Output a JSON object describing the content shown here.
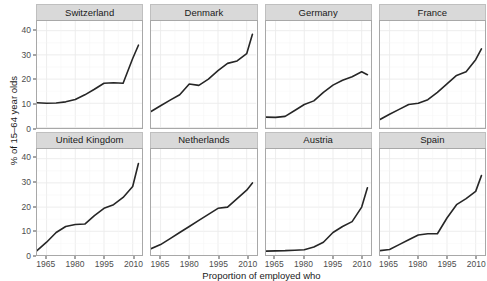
{
  "chart_data": {
    "type": "line",
    "title": "",
    "xlabel": "Proportion of employed who",
    "ylabel": "% of 15–64 year olds",
    "xlim": [
      1960,
      2015
    ],
    "ylim": [
      0,
      44
    ],
    "xticks": [
      1965,
      1980,
      1995,
      2010
    ],
    "yticks": [
      0,
      10,
      20,
      30,
      40
    ],
    "grid": true,
    "legend": "none",
    "facet_layout": "2 rows x 4 columns",
    "line_color": "#262626",
    "panel_background": "#ffffff",
    "strip_background": "#d9d9d9",
    "grid_color": "#ebebeb",
    "series": [
      {
        "name": "Switzerland",
        "x": [
          1960,
          1965,
          1970,
          1975,
          1980,
          1985,
          1990,
          1995,
          2000,
          2005,
          2010,
          2013
        ],
        "values": [
          10.2,
          10.0,
          10.1,
          10.6,
          11.6,
          13.5,
          15.8,
          18.3,
          18.5,
          18.3,
          28.5,
          34.0
        ]
      },
      {
        "name": "Denmark",
        "x": [
          1960,
          1965,
          1970,
          1975,
          1980,
          1985,
          1990,
          1995,
          2000,
          2005,
          2010,
          2013
        ],
        "values": [
          6.6,
          9.0,
          11.3,
          13.5,
          18.0,
          17.4,
          20.0,
          23.5,
          26.5,
          27.5,
          30.5,
          38.5
        ]
      },
      {
        "name": "Germany",
        "x": [
          1960,
          1965,
          1970,
          1975,
          1980,
          1985,
          1990,
          1995,
          2000,
          2005,
          2010,
          2013
        ],
        "values": [
          4.3,
          4.2,
          4.6,
          7.0,
          9.5,
          11.0,
          14.5,
          17.5,
          19.5,
          21.0,
          23.0,
          21.8
        ]
      },
      {
        "name": "France",
        "x": [
          1960,
          1965,
          1970,
          1975,
          1980,
          1985,
          1990,
          1995,
          2000,
          2005,
          2010,
          2013
        ],
        "values": [
          3.3,
          5.5,
          7.5,
          9.5,
          10.0,
          11.5,
          14.5,
          18.0,
          21.5,
          23.0,
          28.0,
          32.5
        ]
      },
      {
        "name": "United Kingdom",
        "x": [
          1960,
          1965,
          1970,
          1975,
          1980,
          1985,
          1990,
          1995,
          2000,
          2005,
          2010,
          2013
        ],
        "values": [
          2.0,
          5.5,
          9.5,
          12.0,
          12.8,
          13.0,
          16.5,
          19.5,
          21.0,
          24.0,
          28.5,
          38.0
        ]
      },
      {
        "name": "Netherlands",
        "x": [
          1960,
          1965,
          1970,
          1975,
          1980,
          1985,
          1990,
          1995,
          2000,
          2005,
          2010,
          2013
        ],
        "values": [
          2.8,
          4.5,
          7.0,
          9.5,
          12.0,
          14.5,
          17.0,
          19.5,
          20.0,
          23.5,
          27.0,
          30.0
        ]
      },
      {
        "name": "Austria",
        "x": [
          1960,
          1965,
          1970,
          1975,
          1980,
          1985,
          1990,
          1995,
          2000,
          2005,
          2010,
          2013
        ],
        "values": [
          1.8,
          1.9,
          2.0,
          2.2,
          2.4,
          3.5,
          5.5,
          9.5,
          12.0,
          14.0,
          20.0,
          28.0
        ]
      },
      {
        "name": "Spain",
        "x": [
          1960,
          1965,
          1970,
          1975,
          1980,
          1985,
          1990,
          1995,
          2000,
          2005,
          2010,
          2013
        ],
        "values": [
          2.0,
          2.5,
          4.5,
          6.5,
          8.5,
          9.0,
          9.0,
          15.5,
          21.0,
          23.5,
          26.5,
          33.0
        ]
      }
    ]
  },
  "axis": {
    "y_title": "% of 15–64 year olds",
    "x_title": "Proportion of employed who",
    "y_ticks": [
      "0",
      "10",
      "20",
      "30",
      "40"
    ],
    "x_ticks": [
      "1965",
      "1980",
      "1995",
      "2010"
    ]
  },
  "facets": [
    {
      "label": "Switzerland"
    },
    {
      "label": "Denmark"
    },
    {
      "label": "Germany"
    },
    {
      "label": "France"
    },
    {
      "label": "United Kingdom"
    },
    {
      "label": "Netherlands"
    },
    {
      "label": "Austria"
    },
    {
      "label": "Spain"
    }
  ]
}
